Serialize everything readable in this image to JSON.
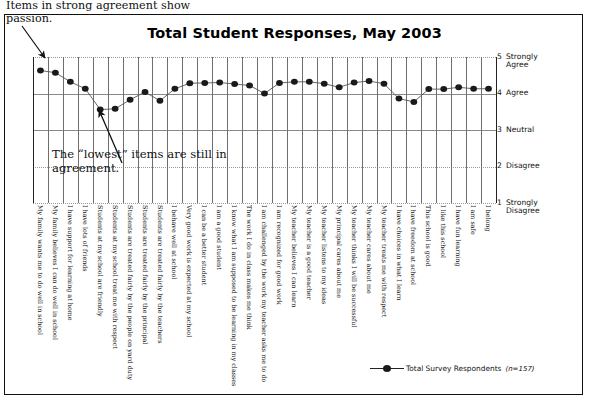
{
  "chart": {
    "title": "Total Student Responses, May 2003"
  },
  "annotations": {
    "top": "Items in strong agreement show passion.",
    "middle": "The “lowest” items are still in agreement."
  },
  "legend": {
    "series_label": "Total Survey Respondents",
    "note": "(n=157)"
  },
  "chart_data": {
    "type": "line",
    "title": "Total Student Responses, May 2003",
    "xlabel": "",
    "ylabel": "",
    "ylim": [
      1,
      5
    ],
    "grid": true,
    "legend_position": "bottom",
    "y_ticks": [
      {
        "value": 5,
        "label": "Strongly Agree"
      },
      {
        "value": 4,
        "label": "Agree"
      },
      {
        "value": 3,
        "label": "Neutral"
      },
      {
        "value": 2,
        "label": "Disagree"
      },
      {
        "value": 1,
        "label": "Strongly Disagree"
      }
    ],
    "categories": [
      "My family wants me to do well in school",
      "My family believes I can do well in school",
      "I have support for learning at home",
      "I have lots of friends",
      "Students at my school are friendly",
      "Students at my school treat me with respect",
      "Students are treated fairly by the people on yard duty",
      "Students are treated fairly by the principal",
      "Students are treated fairly by the teachers",
      "I behave well at school",
      "Very good work is expected at my school",
      "I can be a better student",
      "I am a good student",
      "I know what I am supposed to be learning in my classes",
      "The work I do in class makes me think",
      "I am challenged by the work my teacher asks me to do",
      "I am recognized for good work",
      "My teacher believes I can learn",
      "My teacher is a good teacher",
      "My teacher listens to my ideas",
      "My principal cares about me",
      "My teacher thinks I will be successful",
      "My teacher cares about me",
      "My teacher treats me with respect",
      "I have choices in what I learn",
      "I have freedom at school",
      "This school is good",
      "I like this school",
      "I have fun learning",
      "I am safe",
      "I belong"
    ],
    "series": [
      {
        "name": "Total Survey Respondents",
        "values": [
          4.63,
          4.57,
          4.32,
          4.13,
          3.56,
          3.58,
          3.83,
          4.04,
          3.8,
          4.13,
          4.28,
          4.29,
          4.3,
          4.26,
          4.22,
          4.0,
          4.29,
          4.32,
          4.32,
          4.27,
          4.17,
          4.3,
          4.34,
          4.27,
          3.86,
          3.77,
          4.12,
          4.12,
          4.17,
          4.13,
          4.13
        ]
      }
    ]
  }
}
